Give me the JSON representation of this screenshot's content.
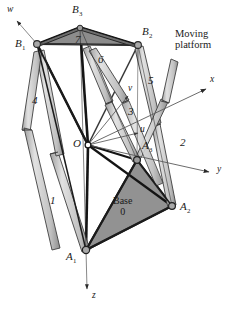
{
  "figure": {
    "colors": {
      "platform_fill": "#8c8c8c",
      "base_fill": "#8a8a8a",
      "leg_fill": "#c9c9c9",
      "leg_stroke": "#4a4a4a",
      "strut_dark": "#1c1c1c",
      "axis_line": "#5a5a5a",
      "joint": "#9a9a9a",
      "text": "#1a1a1a"
    }
  },
  "annotations": {
    "moving_platform": {
      "line1": "Moving",
      "line2": "platform"
    },
    "base": {
      "line1": "Base",
      "line2": "0"
    }
  },
  "joints": {
    "b1": {
      "label": "B",
      "sub": "1",
      "x": 37,
      "y": 44,
      "label_x": 15,
      "label_y": 44
    },
    "b2": {
      "label": "B",
      "sub": "2",
      "x": 138,
      "y": 45,
      "label_x": 142,
      "label_y": 32
    },
    "b3": {
      "label": "B",
      "sub": "3",
      "x": 80,
      "y": 27,
      "label_x": 72,
      "label_y": 10
    },
    "a1": {
      "label": "A",
      "sub": "1",
      "x": 86,
      "y": 250,
      "label_x": 67,
      "label_y": 255
    },
    "a2": {
      "label": "A",
      "sub": "2",
      "x": 172,
      "y": 206,
      "label_x": 180,
      "label_y": 205
    },
    "a3": {
      "label": "A",
      "sub": "3",
      "x": 137,
      "y": 160,
      "label_x": 143,
      "label_y": 144
    },
    "origin": {
      "label": "O",
      "x": 88,
      "y": 145,
      "label_x": 74,
      "label_y": 140
    }
  },
  "legs": [
    {
      "name": "leg-1",
      "label": "1",
      "label_x": 50,
      "label_y": 201
    },
    {
      "name": "leg-2",
      "label": "2",
      "label_x": 180,
      "label_y": 143
    },
    {
      "name": "leg-3",
      "label": "3",
      "label_x": 128,
      "label_y": 112
    },
    {
      "name": "leg-4",
      "label": "4",
      "label_x": 33,
      "label_y": 101
    },
    {
      "name": "leg-5",
      "label": "5",
      "label_x": 148,
      "label_y": 81
    },
    {
      "name": "leg-6",
      "label": "6",
      "label_x": 98,
      "label_y": 60
    },
    {
      "name": "leg-7",
      "label": "7",
      "label_x": 76,
      "label_y": 40
    }
  ],
  "axes": {
    "global": [
      {
        "name": "x-axis",
        "label": "x",
        "label_x": 210,
        "label_y": 79
      },
      {
        "name": "y-axis",
        "label": "y",
        "label_x": 217,
        "label_y": 169
      },
      {
        "name": "z-axis",
        "label": "z",
        "label_x": 92,
        "label_y": 297
      }
    ],
    "local": [
      {
        "name": "u-axis",
        "label": "u",
        "label_x": 141,
        "label_y": 130
      },
      {
        "name": "v-axis",
        "label": "v",
        "label_x": 129,
        "label_y": 88
      },
      {
        "name": "w-axis",
        "label": "w",
        "label_x": 7,
        "label_y": 8
      }
    ]
  }
}
